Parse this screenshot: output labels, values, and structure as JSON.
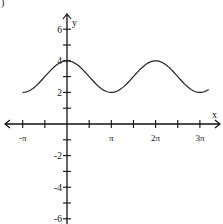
{
  "corner_label": ")",
  "chart_data": {
    "type": "line",
    "title": "",
    "xlabel": "x",
    "ylabel": "y",
    "function": "y = cos(x) + 3",
    "xlim": [
      -3.4,
      10.3
    ],
    "ylim": [
      -6.5,
      6.8
    ],
    "xticks": [
      "-π",
      "π",
      "2π",
      "3π"
    ],
    "xtick_values": [
      -3.14159,
      3.14159,
      6.28319,
      9.42478
    ],
    "minor_xtick_step": 1.5708,
    "yticks": [
      "6",
      "4",
      "2",
      "-2",
      "-4",
      "-6"
    ],
    "ytick_values": [
      6,
      4,
      2,
      -2,
      -4,
      -6
    ],
    "minor_ytick_step": 1,
    "grid": false,
    "series": [
      {
        "name": "curve",
        "x_start": -3.14159,
        "x_end": 10.05,
        "amplitude": 1,
        "midline": 3,
        "period": 6.28319,
        "max": 4,
        "min": 2
      }
    ]
  }
}
